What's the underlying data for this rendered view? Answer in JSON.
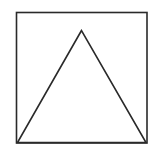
{
  "diagram": {
    "background": "#ffffff",
    "stroke_color": "#2a2a2a",
    "stroke_width": 1.6,
    "square": {
      "x": 16.5,
      "y": 12.5,
      "width": 130.5,
      "height": 130.5
    },
    "triangle": {
      "points": [
        [
          81.5,
          30.5
        ],
        [
          17.5,
          142.5
        ],
        [
          146,
          142.5
        ]
      ]
    }
  }
}
